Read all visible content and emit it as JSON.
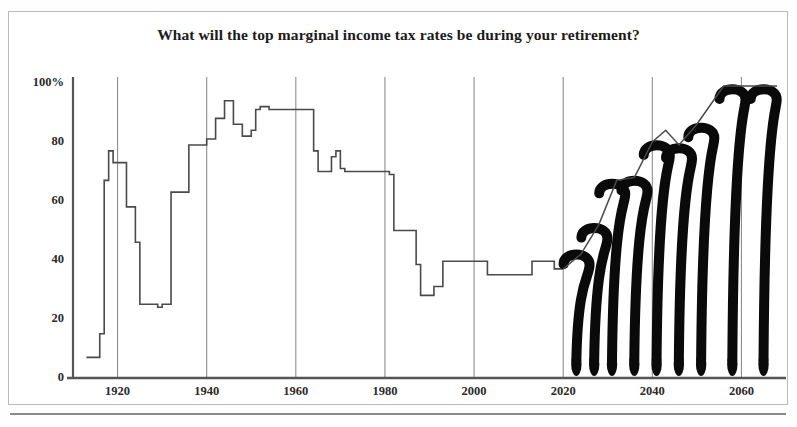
{
  "chart_data": {
    "type": "line",
    "title": "What will the top marginal income tax rates be during your retirement?",
    "xlabel": "",
    "ylabel": "",
    "xlim": [
      1910,
      2070
    ],
    "ylim": [
      0,
      100
    ],
    "grid": true,
    "legend": null,
    "y_ticks": [
      "100%",
      "80",
      "60",
      "40",
      "20",
      "0"
    ],
    "y_tick_values": [
      100,
      80,
      60,
      40,
      20,
      0
    ],
    "x_ticks": [
      "1920",
      "1940",
      "1960",
      "1980",
      "2000",
      "2020",
      "2040",
      "2060"
    ],
    "x_tick_values": [
      1920,
      1940,
      1960,
      1980,
      2000,
      2020,
      2040,
      2060
    ],
    "annotation": "Years after 2020 are drawn as question marks indicating unknown future tax rates",
    "series": [
      {
        "name": "Top marginal income tax rate (historical)",
        "x": [
          1913,
          1915,
          1916,
          1917,
          1918,
          1919,
          1921,
          1922,
          1924,
          1925,
          1929,
          1930,
          1932,
          1936,
          1940,
          1941,
          1942,
          1944,
          1946,
          1948,
          1950,
          1951,
          1952,
          1954,
          1964,
          1965,
          1968,
          1969,
          1970,
          1971,
          1981,
          1982,
          1987,
          1988,
          1991,
          1993,
          2003,
          2013,
          2018,
          2020
        ],
        "y": [
          7,
          7,
          15,
          67,
          77,
          73,
          73,
          58,
          46,
          25,
          24,
          25,
          63,
          79,
          81,
          81,
          88,
          94,
          86,
          82,
          84,
          91,
          92,
          91,
          77,
          70,
          75,
          77,
          71,
          70,
          69,
          50,
          38.5,
          28,
          31,
          39.6,
          35,
          39.6,
          37,
          37
        ]
      },
      {
        "name": "Future projection (unknown)",
        "x": [
          2020,
          2024,
          2028,
          2032,
          2036,
          2040,
          2043,
          2046,
          2050,
          2056,
          2062,
          2068
        ],
        "y": [
          37,
          42,
          52,
          67,
          68,
          80,
          84,
          79,
          86,
          99,
          99,
          99
        ]
      }
    ],
    "question_marks": [
      {
        "x": 2023,
        "top": 43,
        "size": 0.42
      },
      {
        "x": 2027,
        "top": 52,
        "size": 0.52
      },
      {
        "x": 2031,
        "top": 67,
        "size": 0.67
      },
      {
        "x": 2036,
        "top": 68,
        "size": 0.68
      },
      {
        "x": 2041,
        "top": 80,
        "size": 0.8
      },
      {
        "x": 2046,
        "top": 79,
        "size": 0.79
      },
      {
        "x": 2051,
        "top": 86,
        "size": 0.86
      },
      {
        "x": 2058,
        "top": 99,
        "size": 0.99
      },
      {
        "x": 2065,
        "top": 99,
        "size": 0.99
      }
    ],
    "colors": {
      "line": "#4a4a4a",
      "question_mark": "#0a0a0a",
      "grid": "#8d8d8d",
      "axis": "#555555",
      "background": "#ffffff",
      "border": "#b9b9b9",
      "text": "#2a2a2a"
    }
  }
}
